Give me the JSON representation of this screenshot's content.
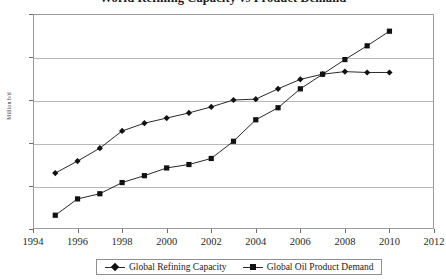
{
  "chart_data": {
    "type": "line",
    "title": "World Refining Capacity vs Product Demand",
    "xlabel": "",
    "ylabel": "Million b/d",
    "xlim": [
      1994,
      2012
    ],
    "ylim": [
      70,
      95
    ],
    "ytick_step": 5,
    "xtick_step": 2,
    "grid": true,
    "legend_position": "bottom",
    "x": [
      1995,
      1996,
      1997,
      1998,
      1999,
      2000,
      2001,
      2002,
      2003,
      2004,
      2005,
      2006,
      2007,
      2008,
      2009,
      2010
    ],
    "xticks": [
      "1994",
      "1996",
      "1998",
      "2000",
      "2002",
      "2004",
      "2006",
      "2008",
      "2010",
      "2012"
    ],
    "yticks": [
      "70",
      "75",
      "80",
      "85",
      "90",
      "95"
    ],
    "series": [
      {
        "name": "Global Refining Capacity",
        "marker": "diamond",
        "color": "#111111",
        "values": [
          76.5,
          77.9,
          79.4,
          81.4,
          82.3,
          82.9,
          83.5,
          84.2,
          85.0,
          85.1,
          86.3,
          87.4,
          88.0,
          88.3,
          88.2,
          88.2
        ]
      },
      {
        "name": "Global Oil Product Demand",
        "marker": "square",
        "color": "#111111",
        "values": [
          71.6,
          73.5,
          74.1,
          75.4,
          76.2,
          77.1,
          77.5,
          78.2,
          80.2,
          82.7,
          84.1,
          86.3,
          88.0,
          89.7,
          91.3,
          93.0
        ]
      }
    ]
  },
  "legend": {
    "items": [
      {
        "label": "Global Refining Capacity",
        "marker": "diamond"
      },
      {
        "label": "Global Oil Product Demand",
        "marker": "square"
      }
    ]
  },
  "axes": {
    "y_title": "Million b/d"
  }
}
